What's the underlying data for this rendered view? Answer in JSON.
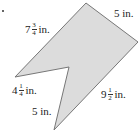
{
  "figure": {
    "shape": "concave hexagon with notch",
    "colors": {
      "fill": "#dcdcdc",
      "stroke": "#777777",
      "text": "#222222"
    },
    "labels": [
      {
        "id": "top-left-side",
        "whole": "7",
        "num": "3",
        "den": "4",
        "unit": "in."
      },
      {
        "id": "top-right-side",
        "whole": "5",
        "num": "",
        "den": "",
        "unit": "in."
      },
      {
        "id": "notch-upper-side",
        "whole": "4",
        "num": "1",
        "den": "4",
        "unit": "in."
      },
      {
        "id": "notch-lower-side",
        "whole": "5",
        "num": "",
        "den": "",
        "unit": "in."
      },
      {
        "id": "bottom-right-side",
        "whole": "9",
        "num": "1",
        "den": "2",
        "unit": "in."
      }
    ]
  }
}
